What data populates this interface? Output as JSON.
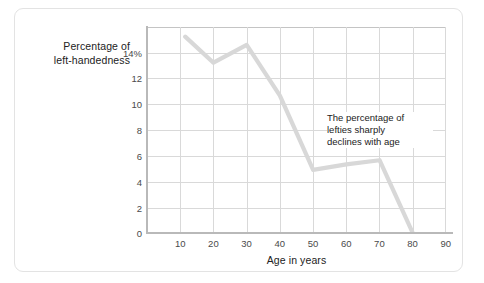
{
  "chart_data": {
    "type": "line",
    "title": "",
    "subtitle": "",
    "xlabel": "Age in years",
    "ylabel": "Percentage of left-handedness",
    "ylabel_lines": [
      "Percentage of",
      "left-handedness"
    ],
    "xlim": [
      0,
      90
    ],
    "ylim": [
      0,
      15
    ],
    "xticks": [
      10,
      20,
      30,
      40,
      50,
      60,
      70,
      80,
      90
    ],
    "xtick_labels": [
      "10",
      "20",
      "30",
      "40",
      "50",
      "60",
      "70",
      "80",
      "90"
    ],
    "yticks": [
      0,
      2,
      4,
      6,
      8,
      10,
      12,
      14
    ],
    "ytick_labels": [
      "0",
      "2",
      "4",
      "6",
      "8",
      "10",
      "12",
      "14%"
    ],
    "grid": true,
    "legend": "none",
    "line_color": "#d8d8d8",
    "grid_color": "#d9d9d9",
    "axis_color": "#b9b9b9",
    "x": [
      11.5,
      20,
      30,
      40,
      50,
      60,
      70,
      80
    ],
    "values": [
      14.3,
      12.4,
      13.7,
      10.0,
      4.6,
      5.0,
      5.3,
      0.0
    ],
    "series": [
      {
        "name": "Percentage of left-handedness",
        "x": [
          11.5,
          20,
          30,
          40,
          50,
          60,
          70,
          80
        ],
        "values": [
          14.3,
          12.4,
          13.7,
          10.0,
          4.6,
          5.0,
          5.3,
          0.0
        ]
      }
    ],
    "annotations": [
      {
        "text": "The percentage of lefties sharply declines with age",
        "lines": [
          "The percentage of",
          "lefties sharply",
          "declines with age"
        ],
        "x": 64,
        "y": 8.6
      }
    ]
  },
  "card": {
    "background": "#ffffff",
    "border_color": "#e3e3e3"
  }
}
